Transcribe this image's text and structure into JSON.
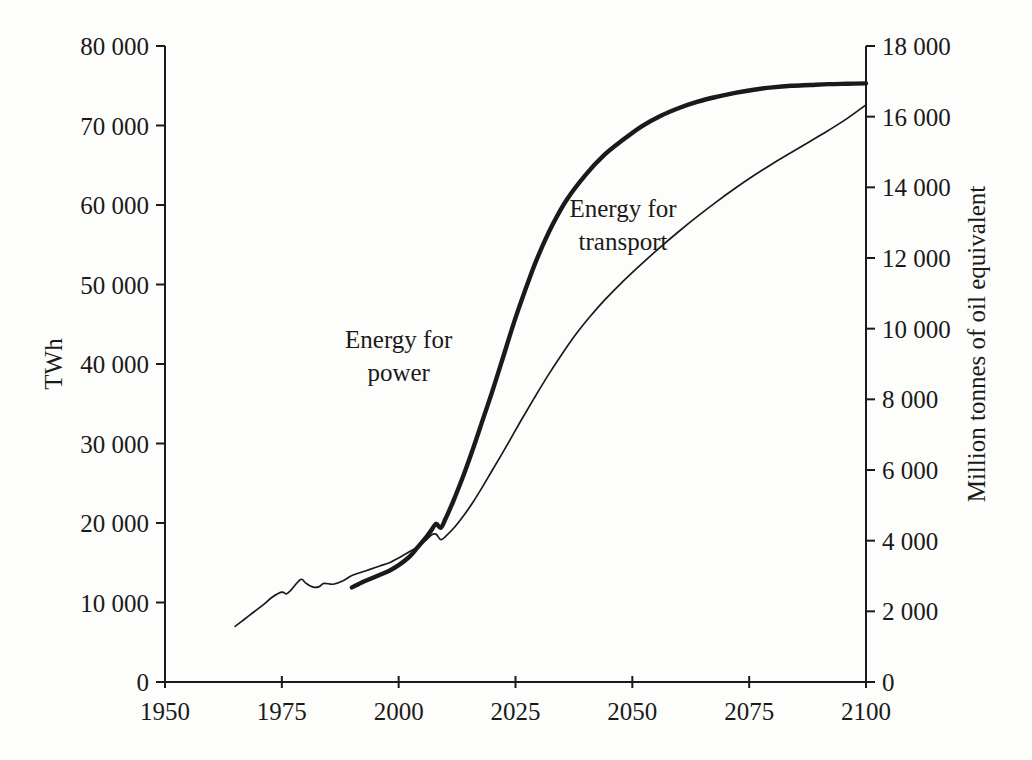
{
  "chart_data": {
    "type": "line",
    "title": "",
    "subtitle": "",
    "xlabel": "",
    "ylabel": "TWh",
    "y2label": "Million tonnes of oil equivalent",
    "grid": false,
    "legend_position": "inline-annotations",
    "xlim": [
      1950,
      2100
    ],
    "ylim": [
      0,
      80000
    ],
    "y2lim": [
      0,
      18000
    ],
    "xticks": [
      1950,
      1975,
      2000,
      2025,
      2050,
      2075,
      2100
    ],
    "xtick_labels": [
      "1950",
      "1975",
      "2000",
      "2025",
      "2050",
      "2075",
      "2100"
    ],
    "yticks": [
      0,
      10000,
      20000,
      30000,
      40000,
      50000,
      60000,
      70000,
      80000
    ],
    "ytick_labels": [
      "0",
      "10 000",
      "20 000",
      "30 000",
      "40 000",
      "50 000",
      "60 000",
      "70 000",
      "80 000"
    ],
    "y2ticks": [
      0,
      2000,
      4000,
      6000,
      8000,
      10000,
      12000,
      14000,
      16000,
      18000
    ],
    "y2tick_labels": [
      "0",
      "2 000",
      "4 000",
      "6 000",
      "8 000",
      "10 000",
      "12 000",
      "14 000",
      "16 000",
      "18 000"
    ],
    "series": [
      {
        "name": "Energy for power",
        "style": "thick",
        "color": "#1a1a1a",
        "label_text_line1": "Energy for",
        "label_text_line2": "power",
        "label_x": 2000,
        "label_y": 42000,
        "x": [
          1990,
          1992,
          1994,
          1996,
          1998,
          2000,
          2002,
          2003,
          2004,
          2005,
          2006,
          2007,
          2008,
          2009,
          2010,
          2011,
          2012,
          2014,
          2016,
          2018,
          2020,
          2022,
          2025,
          2028,
          2030,
          2033,
          2036,
          2040,
          2044,
          2048,
          2052,
          2056,
          2060,
          2064,
          2068,
          2072,
          2076,
          2080,
          2084,
          2088,
          2092,
          2096,
          2100
        ],
        "y": [
          11900,
          12500,
          13000,
          13500,
          14000,
          14700,
          15600,
          16200,
          16900,
          17600,
          18300,
          19100,
          19900,
          19400,
          20500,
          21800,
          23200,
          26200,
          29500,
          33000,
          36500,
          40200,
          45800,
          50800,
          53800,
          57600,
          60700,
          63800,
          66300,
          68200,
          69900,
          71200,
          72200,
          73000,
          73600,
          74100,
          74500,
          74800,
          75000,
          75100,
          75200,
          75250,
          75300
        ]
      },
      {
        "name": "Energy for transport",
        "style": "thin",
        "color": "#1a1a1a",
        "label_text_line1": "Energy for",
        "label_text_line2": "transport",
        "label_x": 2048,
        "label_y": 58500,
        "x": [
          1965,
          1967,
          1969,
          1971,
          1973,
          1975,
          1976,
          1977,
          1979,
          1980,
          1981,
          1982,
          1983,
          1984,
          1986,
          1988,
          1990,
          1992,
          1994,
          1996,
          1998,
          2000,
          2002,
          2004,
          2006,
          2007,
          2008,
          2009,
          2010,
          2012,
          2014,
          2016,
          2018,
          2020,
          2023,
          2026,
          2029,
          2032,
          2035,
          2038,
          2041,
          2044,
          2048,
          2052,
          2056,
          2060,
          2064,
          2068,
          2072,
          2076,
          2080,
          2084,
          2088,
          2092,
          2096,
          2100
        ],
        "y": [
          7000,
          7900,
          8800,
          9700,
          10700,
          11300,
          11100,
          11600,
          12900,
          12500,
          12100,
          11900,
          12000,
          12400,
          12300,
          12700,
          13400,
          13800,
          14200,
          14600,
          15000,
          15600,
          16300,
          17000,
          17900,
          18500,
          18600,
          17900,
          18300,
          19500,
          21000,
          22700,
          24600,
          26600,
          29600,
          32700,
          35700,
          38600,
          41300,
          43800,
          46000,
          48000,
          50400,
          52600,
          54700,
          56700,
          58600,
          60400,
          62100,
          63700,
          65200,
          66600,
          68000,
          69400,
          70900,
          72600
        ]
      }
    ],
    "plot_geometry": {
      "left": 165,
      "right": 866,
      "top": 46,
      "bottom": 682
    }
  }
}
